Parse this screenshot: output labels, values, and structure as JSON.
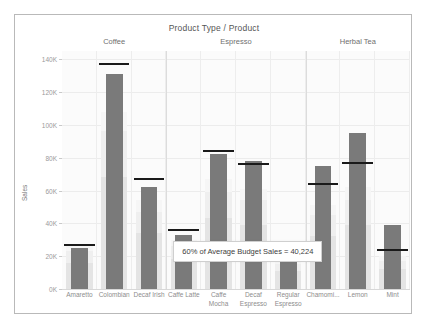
{
  "chart_data": {
    "type": "bar",
    "title": "Product Type / Product",
    "xlabel": "Product Type / Product",
    "ylabel": "Sales",
    "ylim": [
      0,
      145000
    ],
    "grid": true,
    "legend_position": "none",
    "y_ticks": [
      "0K",
      "20K",
      "40K",
      "60K",
      "80K",
      "100K",
      "120K",
      "140K"
    ],
    "y_tick_values": [
      0,
      20000,
      40000,
      60000,
      80000,
      100000,
      120000,
      140000
    ],
    "groups": [
      {
        "label": "Coffee",
        "products": [
          "Amaretto",
          "Colombian",
          "Decaf Irish"
        ]
      },
      {
        "label": "Espresso",
        "products": [
          "Caffe Latte",
          "Caffe Mocha",
          "Decaf Espresso",
          "Regular Espresso"
        ]
      },
      {
        "label": "Herbal Tea",
        "products": [
          "Chamomi...",
          "Lemon",
          "Mint"
        ]
      }
    ],
    "categories": [
      "Amaretto",
      "Colombian",
      "Decaf Irish",
      "Caffe Latte",
      "Caffe Mocha",
      "Decaf Espresso",
      "Regular Espresso",
      "Chamomi...",
      "Lemon",
      "Mint"
    ],
    "series": [
      {
        "name": "Sales",
        "values": [
          25000,
          131000,
          62000,
          33000,
          82000,
          78000,
          20000,
          75000,
          95000,
          39000
        ]
      },
      {
        "name": "Budget Sales (reference line)",
        "values": [
          27000,
          137000,
          67000,
          36000,
          84000,
          76000,
          22000,
          64000,
          77000,
          24000
        ]
      }
    ],
    "distribution_bands": [
      {
        "category": "Amaretto",
        "b1": 16000,
        "b2": 23000,
        "b3": 27000
      },
      {
        "category": "Colombian",
        "b1": 68000,
        "b2": 96000,
        "b3": 108000
      },
      {
        "category": "Decaf Irish",
        "b1": 34000,
        "b2": 47000,
        "b3": 54000
      },
      {
        "category": "Caffe Latte",
        "b1": 18000,
        "b2": 26000,
        "b3": 30000
      },
      {
        "category": "Caffe Mocha",
        "b1": 43000,
        "b2": 59000,
        "b3": 67000
      },
      {
        "category": "Decaf Espresso",
        "b1": 39000,
        "b2": 54000,
        "b3": 61000
      },
      {
        "category": "Regular Espresso",
        "b1": 11000,
        "b2": 15000,
        "b3": 18000
      },
      {
        "category": "Chamomi...",
        "b1": 32000,
        "b2": 45000,
        "b3": 51000
      },
      {
        "category": "Lemon",
        "b1": 39000,
        "b2": 54000,
        "b3": 62000
      },
      {
        "category": "Mint",
        "b1": 12000,
        "b2": 17000,
        "b3": 20000
      }
    ],
    "annotation": {
      "text": "60% of Average Budget Sales = 40,224",
      "value": 40224,
      "percent": "60%"
    },
    "colors": {
      "bar": "#7a7a7a",
      "reference_line": "#1a1a1a",
      "band_dark": "#e4e4e4",
      "band_mid": "#efefef",
      "band_light": "#f6f6f6",
      "plot_background": "#fbfbfb",
      "grid": "#ececec",
      "axis_text": "#9a9a9a"
    }
  }
}
